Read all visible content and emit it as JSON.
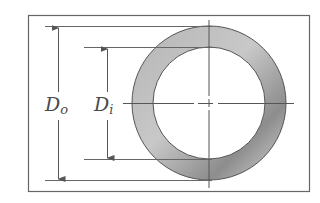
{
  "diagram": {
    "title": "",
    "colors": {
      "line": "#555555",
      "ring_light": "#d8d8d8",
      "ring_dark": "#8a8a8a",
      "background": "#ffffff"
    },
    "frame": {
      "x": 28,
      "y": 15,
      "width": 282,
      "height": 177
    },
    "ring": {
      "cx": 209,
      "cy": 103,
      "outer_radius": 77,
      "inner_radius": 56
    },
    "dimensions": [
      {
        "id": "outer-diameter",
        "symbol": "D",
        "subscript": "o",
        "arrow_x": 58,
        "label_x": 45,
        "label_y": 111,
        "top_y": 26,
        "bottom_y": 180,
        "extension_start_x": 45
      },
      {
        "id": "inner-diameter",
        "symbol": "D",
        "subscript": "i",
        "arrow_x": 107,
        "label_x": 94,
        "label_y": 111,
        "top_y": 47,
        "bottom_y": 159,
        "extension_start_x": 84
      }
    ]
  }
}
